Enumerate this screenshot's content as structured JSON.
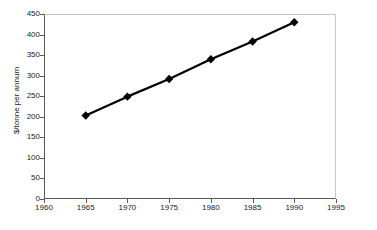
{
  "chart_data": {
    "type": "line",
    "title": "",
    "subtitle": "",
    "xlabel": "",
    "ylabel": "$/tonne per annum",
    "xlim": [
      1960,
      1995
    ],
    "ylim": [
      0,
      450
    ],
    "x": [
      1965,
      1970,
      1975,
      1980,
      1985,
      1990
    ],
    "values": [
      203,
      249,
      292,
      340,
      383,
      430
    ],
    "series": [
      {
        "name": "",
        "x": [
          1965,
          1970,
          1975,
          1980,
          1985,
          1990
        ],
        "values": [
          203,
          249,
          292,
          340,
          383,
          430
        ]
      }
    ],
    "xticks": [
      1960,
      1965,
      1970,
      1975,
      1980,
      1985,
      1990,
      1995
    ],
    "xtick_labels": [
      "1960",
      "1965",
      "1970",
      "1975",
      "1980",
      "1985",
      "1990",
      "1995"
    ],
    "yticks": [
      0,
      50,
      100,
      150,
      200,
      250,
      300,
      350,
      400,
      450
    ],
    "ytick_labels": [
      "0",
      "50",
      "100",
      "150",
      "200",
      "250",
      "300",
      "350",
      "400",
      "450"
    ],
    "grid": false,
    "legend": false,
    "legend_position": "none",
    "marker": "diamond",
    "line_color": "#000000",
    "marker_color": "#000000",
    "plot_background": "#ffffff",
    "frame_color": "#c8c8c8",
    "axis_color": "#5a5a5a",
    "text_color": "#1a1a1a"
  }
}
